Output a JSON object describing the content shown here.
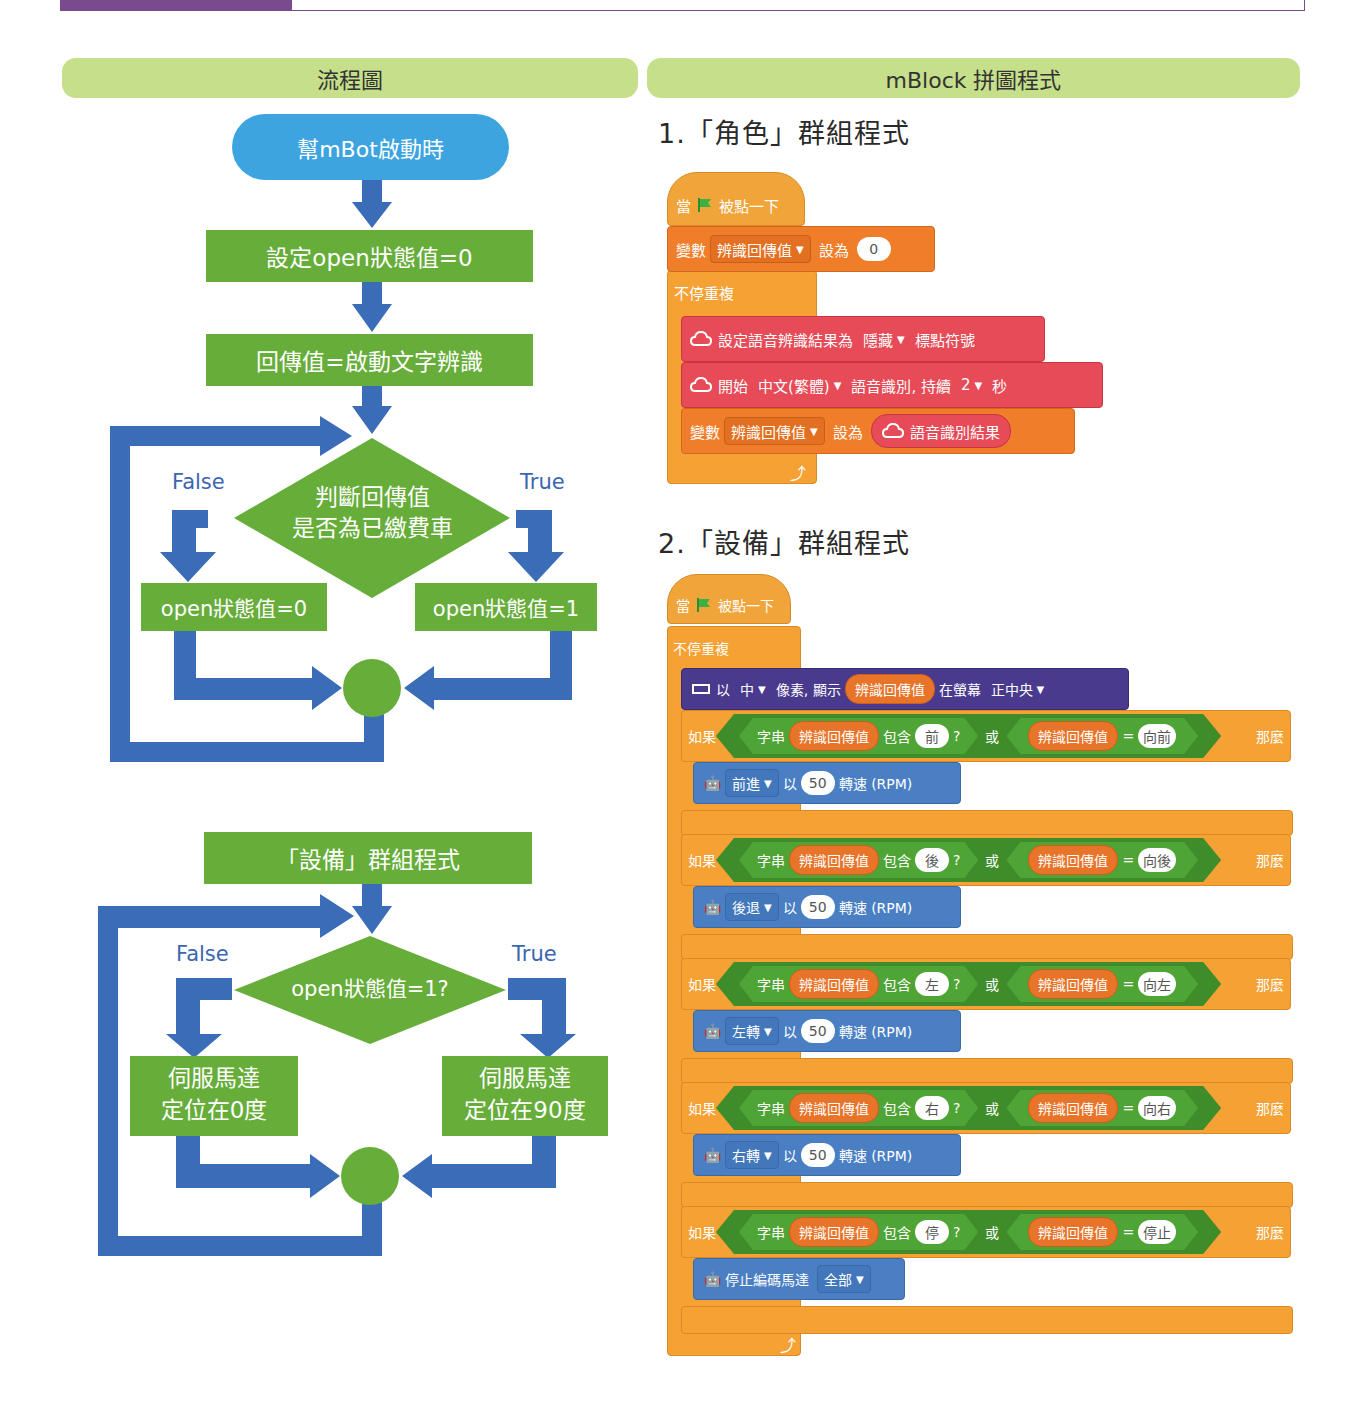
{
  "left_header": "流程圖",
  "right_header": "mBlock 拼圖程式",
  "colors": {
    "accent_purple": "#7a4a8e",
    "header_green": "#c6df8a",
    "flow_blue_arrow": "#3b6cb8",
    "flow_green_box": "#66ad3a",
    "flow_start_blue": "#3ea4e0",
    "event_orange": "#f0a43a",
    "variable_orange": "#f07d2a",
    "cognitive_red": "#e64b57",
    "display_purple": "#4a3a8e",
    "motor_blue": "#4a7fc4",
    "operator_green": "#4fa436"
  },
  "flowchart1": {
    "start": "幫mBot啟動時",
    "step1": "設定open狀態值=0",
    "step2": "回傳值=啟動文字辨識",
    "decision_line1": "判斷回傳值",
    "decision_line2": "是否為已繳費車",
    "false_label": "False",
    "true_label": "True",
    "false_box": "open狀態值=0",
    "true_box": "open狀態值=1"
  },
  "flowchart2": {
    "start": "「設備」群組程式",
    "decision": "open狀態值=1?",
    "false_label": "False",
    "true_label": "True",
    "false_box_line1": "伺服馬達",
    "false_box_line2": "定位在0度",
    "true_box_line1": "伺服馬達",
    "true_box_line2": "定位在90度"
  },
  "program1": {
    "title": "1.「角色」群組程式",
    "hat": {
      "when": "當",
      "clicked": "被點一下"
    },
    "set_var": {
      "label": "變數",
      "var": "辨識回傳值",
      "set_to": "設為",
      "value": "0"
    },
    "forever": "不停重複",
    "set_punct": {
      "label": "設定語音辨識結果為",
      "option": "隱藏",
      "suffix": "標點符號"
    },
    "start_recog": {
      "label": "開始",
      "lang": "中文(繁體)",
      "mid": "語音識別, 持續",
      "secs": "2",
      "unit": "秒"
    },
    "set_var2": {
      "label": "變數",
      "var": "辨識回傳值",
      "set_to": "設為",
      "reporter": "語音識別結果"
    }
  },
  "program2": {
    "title": "2.「設備」群組程式",
    "hat": {
      "when": "當",
      "clicked": "被點一下"
    },
    "forever": "不停重複",
    "display": {
      "prefix": "以",
      "size": "中",
      "mid": "像素, 顯示",
      "var": "辨識回傳值",
      "at": "在螢幕",
      "pos": "正中央"
    },
    "if_label": "如果",
    "then_label": "那麼",
    "str_label": "字串",
    "contains_label": "包含",
    "question": "?",
    "or_label": "或",
    "equals": "=",
    "var_name": "辨識回傳值",
    "with_label": "以",
    "rpm_label": "轉速 (RPM)",
    "conditions": [
      {
        "contains": "前",
        "equals": "向前",
        "action": "前進",
        "speed": "50"
      },
      {
        "contains": "後",
        "equals": "向後",
        "action": "後退",
        "speed": "50"
      },
      {
        "contains": "左",
        "equals": "向左",
        "action": "左轉",
        "speed": "50"
      },
      {
        "contains": "右",
        "equals": "向右",
        "action": "右轉",
        "speed": "50"
      },
      {
        "contains": "停",
        "equals": "停止",
        "action": "停止編碼馬達",
        "option": "全部"
      }
    ]
  }
}
